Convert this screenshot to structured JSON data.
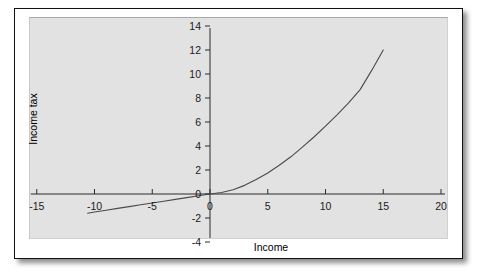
{
  "chart_data": {
    "type": "line",
    "title": "",
    "subtitle": "",
    "xlabel": "Income",
    "ylabel": "Income tax",
    "xlim": [
      -17.5,
      21.5
    ],
    "ylim": [
      -4.6,
      14.6
    ],
    "xticks": [
      -15,
      -10,
      -5,
      0,
      5,
      10,
      15,
      20
    ],
    "yticks": [
      -4,
      -2,
      0,
      2,
      4,
      6,
      8,
      10,
      12,
      14
    ],
    "xticklabels": [
      "-15",
      "-10",
      "-5",
      "0",
      "5",
      "10",
      "15",
      "20"
    ],
    "yticklabels": [
      "-4",
      "-2",
      "0",
      "2",
      "4",
      "6",
      "8",
      "10",
      "12",
      "14"
    ],
    "grid": false,
    "legend": null,
    "legend_position": "none",
    "panel_background": "#e2e2e2",
    "line_color": "#4a4a4a",
    "axis_color": "#2b2b2b",
    "series": [
      {
        "name": "Income tax",
        "x": [
          -10.6,
          -10.0,
          -9.0,
          -8.0,
          -7.0,
          -6.0,
          -5.0,
          -4.0,
          -3.0,
          -2.0,
          -1.0,
          0.0,
          1.0,
          2.0,
          3.0,
          4.0,
          5.0,
          6.0,
          7.0,
          8.0,
          9.0,
          10.0,
          11.0,
          12.0,
          13.0,
          14.0,
          15.0
        ],
        "y": [
          -1.6,
          -1.5,
          -1.35,
          -1.2,
          -1.05,
          -0.9,
          -0.75,
          -0.6,
          -0.45,
          -0.3,
          -0.15,
          0.0,
          0.12,
          0.36,
          0.72,
          1.2,
          1.75,
          2.4,
          3.1,
          3.9,
          4.75,
          5.65,
          6.6,
          7.6,
          8.7,
          10.3,
          12.0
        ]
      }
    ],
    "annotations": []
  },
  "axes": {
    "x_title": "Income",
    "y_title": "Income tax"
  }
}
